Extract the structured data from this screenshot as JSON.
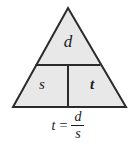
{
  "figure": {
    "name": "formula-triangle-mnemonic",
    "background_color": "#ffffff",
    "triangle": {
      "fill_color": "#e8e8e8",
      "stroke_color": "#2b2b2b",
      "stroke_width": 2,
      "apex": [
        68,
        8
      ],
      "base_left": [
        13,
        107
      ],
      "base_right": [
        126,
        107
      ],
      "horizontal_divider_y": 65,
      "vertical_divider_x": 68
    },
    "cells": [
      {
        "id": "top",
        "label": "d",
        "style": "italic"
      },
      {
        "id": "bottom-left",
        "label": "s",
        "style": "italic"
      },
      {
        "id": "bottom-right",
        "label": "t",
        "style": "italic-bold"
      }
    ],
    "formula": {
      "lhs": "t",
      "equals": "=",
      "numerator": "d",
      "denominator": "s",
      "full_text": "t = d/s"
    }
  }
}
